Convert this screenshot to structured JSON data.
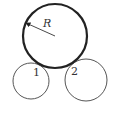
{
  "diagram": {
    "big_circle": {
      "cx": 55,
      "cy": 36,
      "r": 32,
      "stroke_width": 2.2,
      "radius_label": "R"
    },
    "circle_1": {
      "cx": 31,
      "cy": 81,
      "r": 18,
      "label": "1"
    },
    "circle_2": {
      "cx": 86,
      "cy": 80,
      "r": 21,
      "label": "2"
    },
    "colors": {
      "stroke": "#222222",
      "thin_stroke": "#555555"
    }
  }
}
